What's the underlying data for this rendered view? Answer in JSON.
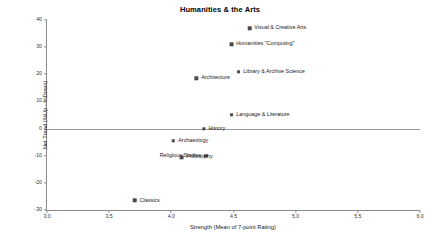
{
  "chart_data": {
    "type": "scatter",
    "title": "Humanities & the Arts",
    "xlabel": "Strength (Mean of 7-point Rating)",
    "ylabel": "Net Trend (%Up - %Down)",
    "xlim": [
      3.0,
      6.0
    ],
    "ylim": [
      -30,
      40
    ],
    "xticks": [
      "3.0",
      "3.5",
      "4.0",
      "4.5",
      "5.0",
      "5.5",
      "6.0"
    ],
    "xtick_values": [
      3.0,
      3.5,
      4.0,
      4.5,
      5.0,
      5.5,
      6.0
    ],
    "yticks": [
      "40",
      "30",
      "20",
      "10",
      "0",
      "-10",
      "-20",
      "-30"
    ],
    "ytick_values": [
      40,
      30,
      20,
      10,
      0,
      -10,
      -20,
      -30
    ],
    "grid": false,
    "legend": "none",
    "zero_reference_line": 0,
    "marker_color": "#4a4a4a",
    "axis_color": "#8a8a8a",
    "points": [
      {
        "label": "Visual & Creative Arts",
        "x": 4.85,
        "y": 37.0,
        "label_side": "right"
      },
      {
        "label": "Humanities \"Computing\"",
        "x": 4.73,
        "y": 31.0,
        "label_side": "right"
      },
      {
        "label": "Library & Archive Science",
        "x": 4.8,
        "y": 21.0,
        "label_side": "right"
      },
      {
        "label": "Architecture",
        "x": 4.33,
        "y": 18.5,
        "label_side": "right"
      },
      {
        "label": "Language & Literature",
        "x": 4.71,
        "y": 5.0,
        "label_side": "right"
      },
      {
        "label": "History",
        "x": 4.34,
        "y": 0.0,
        "label_side": "right"
      },
      {
        "label": "Archaeology",
        "x": 4.15,
        "y": -4.5,
        "label_side": "right"
      },
      {
        "label": "Religious Studies",
        "x": 4.1,
        "y": -10.0,
        "label_side": "left"
      },
      {
        "label": "Philosophy",
        "x": 4.2,
        "y": -10.5,
        "label_side": "right"
      },
      {
        "label": "Classics",
        "x": 3.8,
        "y": -26.5,
        "label_side": "right"
      }
    ]
  }
}
